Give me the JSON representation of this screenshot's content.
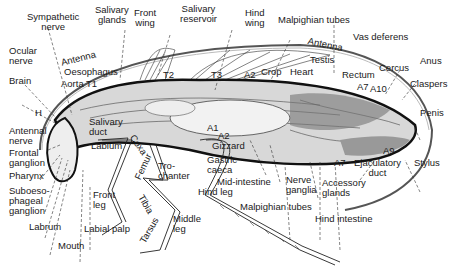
{
  "diagram": {
    "labels": {
      "sympathetic_nerve": "Sympathetic\nnerve",
      "salivary_glands": "Salivary\nglands",
      "front_wing": "Front\nwing",
      "salivary_reservoir": "Salivary\nreservoir",
      "hind_wing": "Hind\nwing",
      "malpighian_tubes_top": "Malpighian tubes",
      "vas_deferens": "Vas deferens",
      "antenna_left": "Antenna",
      "antenna_right": "Antenna",
      "ocular_nerve": "Ocular\nnerve",
      "brain": "Brain",
      "oesophagus": "Oesophagus",
      "aorta": "Aorta",
      "t1": "T1",
      "t2": "T2",
      "t3": "T3",
      "a2_top": "A2",
      "crop": "Crop",
      "heart": "Heart",
      "testis": "Testis",
      "rectum": "Rectum",
      "cercus": "Cercus",
      "anus": "Anus",
      "claspers": "Claspers",
      "a7_top": "A7",
      "a10": "A10",
      "penis": "Penis",
      "h": "H",
      "antennal_nerve": "Antennal\nnerve",
      "frontal_ganglion": "Frontal\nganglion",
      "pharynx": "Pharynx",
      "suboesophageal_ganglion": "Suboeso-\nphageal\nganglion",
      "labrum": "Labrum",
      "mouth": "Mouth",
      "salivary_duct": "Salivary\nduct",
      "labium": "Labium",
      "front_leg": "Front\nleg",
      "labial_palp": "Labial palp",
      "coxa": "Coxa",
      "femur": "Femur",
      "trochanter": "Tro-\nchanter",
      "tibia": "Tibia",
      "tarsus": "Tarsus",
      "middle_leg": "Middle\nleg",
      "a1": "A1",
      "a2_bottom": "A2",
      "gizzard": "Gizzard",
      "gastric_caeca": "Gastric\ncaeca",
      "mid_intestine": "Mid-intestine",
      "hind_leg": "Hind leg",
      "malpighian_tubes_bottom": "Malpighian tubes",
      "nerve_ganglia": "Nerve\nganglia",
      "a7_bottom": "A7",
      "accessory_glands": "Accessory\nglands",
      "hind_intestine": "Hind intestine",
      "ejaculatory_duct": "Ejaculatory\nduct",
      "a9": "A9",
      "stylus": "Stylus"
    }
  }
}
